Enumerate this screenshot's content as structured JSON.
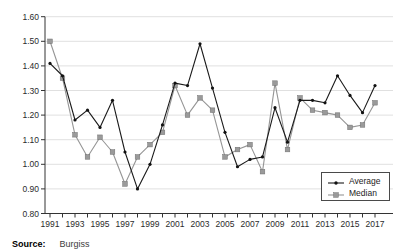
{
  "source": {
    "label": "Source:",
    "value": "Burgiss"
  },
  "chart_data": {
    "type": "line",
    "title": "",
    "xlabel": "",
    "ylabel": "",
    "grid": "horizontal",
    "legend_position": "lower right",
    "ylim": [
      0.8,
      1.6
    ],
    "ytick_step": 0.1,
    "ytick_labels": [
      "0.80",
      "0.90",
      "1.00",
      "1.10",
      "1.20",
      "1.30",
      "1.40",
      "1.50",
      "1.60"
    ],
    "x": [
      1991,
      1992,
      1993,
      1994,
      1995,
      1996,
      1997,
      1998,
      1999,
      2000,
      2001,
      2002,
      2003,
      2004,
      2005,
      2006,
      2007,
      2008,
      2009,
      2010,
      2011,
      2012,
      2013,
      2014,
      2015,
      2016,
      2017
    ],
    "xtick_labels": [
      "1991",
      "1993",
      "1995",
      "1997",
      "1999",
      "2001",
      "2003",
      "2005",
      "2007",
      "2009",
      "2011",
      "2013",
      "2015",
      "2017"
    ],
    "series": [
      {
        "name": "Average",
        "marker": "dot",
        "color": "#1a1a1a",
        "values": [
          1.41,
          1.36,
          1.18,
          1.22,
          1.15,
          1.26,
          1.05,
          0.9,
          1.0,
          1.16,
          1.33,
          1.32,
          1.49,
          1.31,
          1.13,
          0.99,
          1.02,
          1.03,
          1.23,
          1.09,
          1.26,
          1.26,
          1.25,
          1.36,
          1.28,
          1.21,
          1.32
        ]
      },
      {
        "name": "Median",
        "marker": "square",
        "color": "#959595",
        "values": [
          1.5,
          1.35,
          1.12,
          1.03,
          1.11,
          1.05,
          0.92,
          1.03,
          1.08,
          1.13,
          1.32,
          1.2,
          1.27,
          1.22,
          1.03,
          1.06,
          1.08,
          0.97,
          1.33,
          1.06,
          1.27,
          1.22,
          1.21,
          1.2,
          1.15,
          1.16,
          1.25
        ]
      }
    ],
    "colors": {
      "grid": "#e0e0e0",
      "axis": "#333333",
      "tick_text": "#2b2b2b"
    }
  }
}
